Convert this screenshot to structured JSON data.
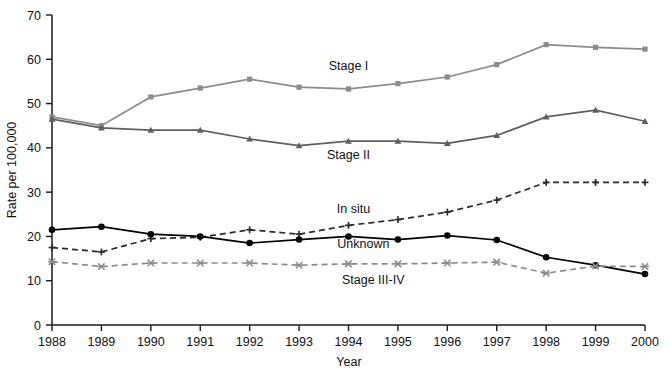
{
  "chart_data": {
    "type": "line",
    "title": "",
    "subtitle": "",
    "xlabel": "Year",
    "ylabel": "Rate per 100,000",
    "grid": false,
    "legend_position": "inline-annotations",
    "x": [
      1988,
      1989,
      1990,
      1991,
      1992,
      1993,
      1994,
      1995,
      1996,
      1997,
      1998,
      1999,
      2000
    ],
    "xtick_labels": [
      "1988",
      "1989",
      "1990",
      "1991",
      "1992",
      "1993",
      "1994",
      "1995",
      "1996",
      "1997",
      "1998",
      "1999",
      "2000"
    ],
    "ytick_labels": [
      "0",
      "10",
      "20",
      "30",
      "40",
      "50",
      "60",
      "70"
    ],
    "yticks": [
      0,
      10,
      20,
      30,
      40,
      50,
      60,
      70
    ],
    "xlim": [
      1988,
      2000
    ],
    "ylim": [
      0,
      70
    ],
    "series": [
      {
        "name": "Stage I",
        "values": [
          47.0,
          45.0,
          51.5,
          53.5,
          55.5,
          53.7,
          53.3,
          54.5,
          56.0,
          58.8,
          63.3,
          62.7,
          62.3
        ],
        "color": "#8c8c8c",
        "dash": "none",
        "marker": "square",
        "label_x": 1994.0,
        "label_y": 57.5
      },
      {
        "name": "Stage II",
        "values": [
          46.5,
          44.5,
          44.0,
          44.0,
          42.0,
          40.5,
          41.5,
          41.5,
          41.0,
          42.8,
          47.0,
          48.5,
          46.0
        ],
        "color": "#5f5f5f",
        "dash": "none",
        "marker": "triangle",
        "label_x": 1994.0,
        "label_y": 37.5
      },
      {
        "name": "In situ",
        "values": [
          17.5,
          16.5,
          19.5,
          19.8,
          21.5,
          20.5,
          22.5,
          23.8,
          25.5,
          28.2,
          32.2,
          32.2,
          32.2
        ],
        "color": "#2b2b2b",
        "dash": "dashed",
        "marker": "plus",
        "label_x": 1994.1,
        "label_y": 25.2
      },
      {
        "name": "Unknown",
        "values": [
          21.5,
          22.2,
          20.5,
          20.0,
          18.5,
          19.3,
          20.0,
          19.3,
          20.2,
          19.2,
          15.3,
          13.5,
          11.5
        ],
        "color": "#000000",
        "dash": "none",
        "marker": "circle",
        "label_x": 1994.3,
        "label_y": 17.3
      },
      {
        "name": "Stage III-IV",
        "values": [
          14.3,
          13.2,
          14.0,
          14.0,
          14.0,
          13.5,
          13.8,
          13.8,
          14.0,
          14.2,
          11.7,
          13.3,
          13.2
        ],
        "color": "#8c8c8c",
        "dash": "dashed",
        "marker": "x",
        "label_x": 1994.5,
        "label_y": 9.3
      }
    ]
  },
  "axes": {
    "y_title": "Rate per 100,000",
    "x_title": "Year"
  }
}
